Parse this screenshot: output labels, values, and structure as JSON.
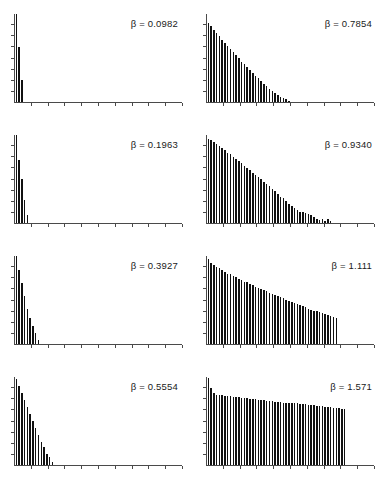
{
  "figure": {
    "type": "multi-panel-bar-chart-grid",
    "rows": 4,
    "columns": 2,
    "background_color": "#ffffff",
    "bar_color": "#111111",
    "axis_color": "#4a4a4a"
  },
  "chart_data": [
    {
      "type": "bar",
      "panel_index": 0,
      "grid_position": {
        "row": 0,
        "col": 0
      },
      "title": "β = 0.0982",
      "label_symbol": "β",
      "label_operator": "=",
      "label_value": "0.0982",
      "beta": 0.0982,
      "xlabel": "",
      "ylabel": "",
      "grid": false,
      "legend": false,
      "xlim": [
        0,
        60
      ],
      "ylim": [
        0,
        1
      ],
      "x_ticks": 10,
      "y_ticks": 7,
      "categories": [
        1,
        2,
        3
      ],
      "values": [
        1.0,
        0.63,
        0.25
      ]
    },
    {
      "type": "bar",
      "panel_index": 1,
      "grid_position": {
        "row": 0,
        "col": 1
      },
      "title": "β = 0.7854",
      "label_symbol": "β",
      "label_operator": "=",
      "label_value": "0.7854",
      "beta": 0.7854,
      "xlabel": "",
      "ylabel": "",
      "grid": false,
      "legend": false,
      "xlim": [
        0,
        60
      ],
      "ylim": [
        0,
        1
      ],
      "x_ticks": 10,
      "y_ticks": 7,
      "categories": [
        1,
        2,
        3,
        4,
        5,
        6,
        7,
        8,
        9,
        10,
        11,
        12,
        13,
        14,
        15,
        16,
        17,
        18,
        19,
        20,
        21,
        22,
        23,
        24,
        25,
        26,
        27,
        28,
        29,
        30
      ],
      "values": [
        0.9,
        0.86,
        0.82,
        0.78,
        0.75,
        0.71,
        0.67,
        0.64,
        0.6,
        0.57,
        0.53,
        0.5,
        0.46,
        0.43,
        0.4,
        0.36,
        0.33,
        0.3,
        0.27,
        0.24,
        0.21,
        0.18,
        0.15,
        0.13,
        0.1,
        0.08,
        0.06,
        0.04,
        0.03,
        0.01
      ]
    },
    {
      "type": "bar",
      "panel_index": 2,
      "grid_position": {
        "row": 1,
        "col": 0
      },
      "title": "β = 0.1963",
      "label_symbol": "β",
      "label_operator": "=",
      "label_value": "0.1963",
      "beta": 0.1963,
      "xlabel": "",
      "ylabel": "",
      "grid": false,
      "legend": false,
      "xlim": [
        0,
        60
      ],
      "ylim": [
        0,
        1
      ],
      "x_ticks": 10,
      "y_ticks": 7,
      "categories": [
        1,
        2,
        3,
        4,
        5
      ],
      "values": [
        1.0,
        0.72,
        0.5,
        0.26,
        0.09
      ]
    },
    {
      "type": "bar",
      "panel_index": 3,
      "grid_position": {
        "row": 1,
        "col": 1
      },
      "title": "β = 0.9340",
      "label_symbol": "β",
      "label_operator": "=",
      "label_value": "0.9340",
      "beta": 0.934,
      "xlabel": "",
      "ylabel": "",
      "grid": false,
      "legend": false,
      "xlim": [
        0,
        60
      ],
      "ylim": [
        0,
        1
      ],
      "x_ticks": 10,
      "y_ticks": 7,
      "categories": [
        1,
        2,
        3,
        4,
        5,
        6,
        7,
        8,
        9,
        10,
        11,
        12,
        13,
        14,
        15,
        16,
        17,
        18,
        19,
        20,
        21,
        22,
        23,
        24,
        25,
        26,
        27,
        28,
        29,
        30,
        31,
        32,
        33,
        34,
        35,
        36,
        37,
        38,
        39,
        40,
        41,
        42,
        43,
        44,
        45
      ],
      "values": [
        0.96,
        0.94,
        0.92,
        0.9,
        0.87,
        0.85,
        0.83,
        0.8,
        0.78,
        0.75,
        0.73,
        0.7,
        0.68,
        0.65,
        0.62,
        0.6,
        0.57,
        0.55,
        0.52,
        0.5,
        0.47,
        0.44,
        0.42,
        0.39,
        0.36,
        0.33,
        0.3,
        0.28,
        0.25,
        0.22,
        0.19,
        0.17,
        0.15,
        0.13,
        0.12,
        0.11,
        0.1,
        0.09,
        0.07,
        0.04,
        0.03,
        0.05,
        0.02,
        0.04,
        0.02
      ]
    },
    {
      "type": "bar",
      "panel_index": 4,
      "grid_position": {
        "row": 2,
        "col": 0
      },
      "title": "β = 0.3927",
      "label_symbol": "β",
      "label_operator": "=",
      "label_value": "0.3927",
      "beta": 0.3927,
      "xlabel": "",
      "ylabel": "",
      "grid": false,
      "legend": false,
      "xlim": [
        0,
        60
      ],
      "ylim": [
        0,
        1
      ],
      "x_ticks": 10,
      "y_ticks": 7,
      "categories": [
        1,
        2,
        3,
        4,
        5,
        6,
        7,
        8,
        9
      ],
      "values": [
        1.0,
        0.84,
        0.69,
        0.55,
        0.4,
        0.3,
        0.2,
        0.12,
        0.04
      ]
    },
    {
      "type": "bar",
      "panel_index": 5,
      "grid_position": {
        "row": 2,
        "col": 1
      },
      "title": "β = 1.111",
      "label_symbol": "β",
      "label_operator": "=",
      "label_value": "1.111",
      "beta": 1.111,
      "xlabel": "",
      "ylabel": "",
      "grid": false,
      "legend": false,
      "xlim": [
        0,
        60
      ],
      "ylim": [
        0,
        1
      ],
      "x_ticks": 10,
      "y_ticks": 7,
      "categories": [
        1,
        2,
        3,
        4,
        5,
        6,
        7,
        8,
        9,
        10,
        11,
        12,
        13,
        14,
        15,
        16,
        17,
        18,
        19,
        20,
        21,
        22,
        23,
        24,
        25,
        26,
        27,
        28,
        29,
        30,
        31,
        32,
        33,
        34,
        35,
        36,
        37,
        38,
        39,
        40,
        41,
        42,
        43,
        44,
        45,
        46,
        47
      ],
      "values": [
        0.97,
        0.92,
        0.9,
        0.88,
        0.86,
        0.84,
        0.82,
        0.8,
        0.79,
        0.77,
        0.76,
        0.74,
        0.73,
        0.71,
        0.7,
        0.68,
        0.67,
        0.65,
        0.64,
        0.62,
        0.61,
        0.6,
        0.58,
        0.57,
        0.56,
        0.54,
        0.53,
        0.52,
        0.5,
        0.49,
        0.48,
        0.47,
        0.45,
        0.44,
        0.43,
        0.42,
        0.4,
        0.39,
        0.38,
        0.37,
        0.36,
        0.35,
        0.34,
        0.33,
        0.32,
        0.31,
        0.3
      ]
    },
    {
      "type": "bar",
      "panel_index": 6,
      "grid_position": {
        "row": 3,
        "col": 0
      },
      "title": "β = 0.5554",
      "label_symbol": "β",
      "label_operator": "=",
      "label_value": "0.5554",
      "beta": 0.5554,
      "xlabel": "",
      "ylabel": "",
      "grid": false,
      "legend": false,
      "xlim": [
        0,
        60
      ],
      "ylim": [
        0,
        1
      ],
      "x_ticks": 10,
      "y_ticks": 7,
      "categories": [
        1,
        2,
        3,
        4,
        5,
        6,
        7,
        8,
        9,
        10,
        11,
        12,
        13,
        14
      ],
      "values": [
        0.98,
        0.9,
        0.82,
        0.74,
        0.66,
        0.58,
        0.5,
        0.42,
        0.34,
        0.26,
        0.2,
        0.13,
        0.09,
        0.03
      ]
    },
    {
      "type": "bar",
      "panel_index": 7,
      "grid_position": {
        "row": 3,
        "col": 1
      },
      "title": "β = 1.571",
      "label_symbol": "β",
      "label_operator": "=",
      "label_value": "1.571",
      "beta": 1.571,
      "xlabel": "",
      "ylabel": "",
      "grid": false,
      "legend": false,
      "xlim": [
        0,
        60
      ],
      "ylim": [
        0,
        1
      ],
      "x_ticks": 10,
      "y_ticks": 7,
      "categories": [
        1,
        2,
        3,
        4,
        5,
        6,
        7,
        8,
        9,
        10,
        11,
        12,
        13,
        14,
        15,
        16,
        17,
        18,
        19,
        20,
        21,
        22,
        23,
        24,
        25,
        26,
        27,
        28,
        29,
        30,
        31,
        32,
        33,
        34,
        35,
        36,
        37,
        38,
        39,
        40,
        41,
        42,
        43,
        44,
        45,
        46,
        47,
        48,
        49,
        50
      ],
      "values": [
        0.99,
        0.88,
        0.82,
        0.8,
        0.79,
        0.79,
        0.78,
        0.78,
        0.78,
        0.77,
        0.77,
        0.77,
        0.76,
        0.76,
        0.76,
        0.75,
        0.75,
        0.75,
        0.74,
        0.74,
        0.74,
        0.73,
        0.73,
        0.73,
        0.72,
        0.72,
        0.72,
        0.71,
        0.71,
        0.71,
        0.7,
        0.7,
        0.7,
        0.69,
        0.69,
        0.69,
        0.68,
        0.68,
        0.68,
        0.67,
        0.67,
        0.67,
        0.66,
        0.66,
        0.66,
        0.65,
        0.65,
        0.65,
        0.64,
        0.64
      ]
    }
  ]
}
